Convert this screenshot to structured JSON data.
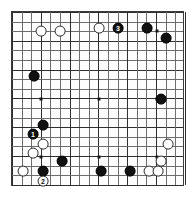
{
  "diagram": {
    "kind": "go-board-diagram",
    "board_size": 19,
    "grid": {
      "left_px": 11,
      "top_px": 11,
      "width_px": 173,
      "height_px": 175,
      "spacing_px": 9.6,
      "line_color": "#6d6d6d",
      "strong_line_color": "#2f2f2f",
      "border_color": "#3b3b3b",
      "background_color": "#fdfdfd"
    },
    "colors": {
      "black_stone": "#111111",
      "white_stone": "#ffffff",
      "white_stone_outline": "#2b2b2b",
      "black_label_text": "#ffffff",
      "white_label_text": "#111111",
      "page_background": "#ffffff"
    },
    "star_points": [
      {
        "x": 40,
        "y": 30
      },
      {
        "x": 98,
        "y": 30
      },
      {
        "x": 156,
        "y": 30
      },
      {
        "x": 40,
        "y": 98
      },
      {
        "x": 98,
        "y": 98
      },
      {
        "x": 156,
        "y": 98
      },
      {
        "x": 40,
        "y": 156
      },
      {
        "x": 98,
        "y": 156
      },
      {
        "x": 156,
        "y": 156
      }
    ],
    "stones": [
      {
        "id": "w-d17",
        "color": "white",
        "x": 40,
        "y": 30,
        "r": 5.4,
        "label": ""
      },
      {
        "id": "w-f17",
        "color": "white",
        "x": 59,
        "y": 30,
        "r": 5.4,
        "label": ""
      },
      {
        "id": "w-k17",
        "color": "white",
        "x": 98,
        "y": 27,
        "r": 5.4,
        "label": ""
      },
      {
        "id": "b-m17",
        "color": "black",
        "x": 117,
        "y": 27,
        "r": 5.4,
        "label": "3"
      },
      {
        "id": "b-p17",
        "color": "black",
        "x": 146,
        "y": 27,
        "r": 5.4,
        "label": ""
      },
      {
        "id": "b-r16",
        "color": "black",
        "x": 165,
        "y": 37,
        "r": 5.4,
        "label": ""
      },
      {
        "id": "b-d14",
        "color": "black",
        "x": 33,
        "y": 75,
        "r": 5.4,
        "label": ""
      },
      {
        "id": "b-r10",
        "color": "black",
        "x": 160,
        "y": 98,
        "r": 5.4,
        "label": ""
      },
      {
        "id": "b-e8",
        "color": "black",
        "x": 42,
        "y": 124,
        "r": 5.4,
        "label": ""
      },
      {
        "id": "b-d7",
        "color": "black",
        "x": 32,
        "y": 133,
        "r": 5.4,
        "label": "1"
      },
      {
        "id": "w-e6",
        "color": "white",
        "x": 42,
        "y": 143,
        "r": 5.4,
        "label": ""
      },
      {
        "id": "w-d5",
        "color": "white",
        "x": 32,
        "y": 152,
        "r": 5.4,
        "label": ""
      },
      {
        "id": "w-r6",
        "color": "white",
        "x": 167,
        "y": 143,
        "r": 5.4,
        "label": ""
      },
      {
        "id": "b-g4",
        "color": "black",
        "x": 61,
        "y": 160,
        "r": 5.4,
        "label": ""
      },
      {
        "id": "w-q4",
        "color": "white",
        "x": 160,
        "y": 160,
        "r": 5.4,
        "label": ""
      },
      {
        "id": "w-c3",
        "color": "white",
        "x": 22,
        "y": 170,
        "r": 5.4,
        "label": ""
      },
      {
        "id": "b-e3",
        "color": "black",
        "x": 42,
        "y": 170,
        "r": 5.4,
        "label": ""
      },
      {
        "id": "b-k3",
        "color": "black",
        "x": 100,
        "y": 170,
        "r": 5.4,
        "label": ""
      },
      {
        "id": "b-n3",
        "color": "black",
        "x": 129,
        "y": 170,
        "r": 5.4,
        "label": ""
      },
      {
        "id": "w-p3",
        "color": "white",
        "x": 148,
        "y": 170,
        "r": 5.4,
        "label": ""
      },
      {
        "id": "w-q3",
        "color": "white",
        "x": 157,
        "y": 170,
        "r": 5.4,
        "label": ""
      },
      {
        "id": "w-e2",
        "color": "white",
        "x": 42,
        "y": 180,
        "r": 5.4,
        "label": "2"
      }
    ],
    "move_labels": [
      {
        "number": "1",
        "color": "black"
      },
      {
        "number": "2",
        "color": "white"
      },
      {
        "number": "3",
        "color": "black"
      }
    ]
  }
}
